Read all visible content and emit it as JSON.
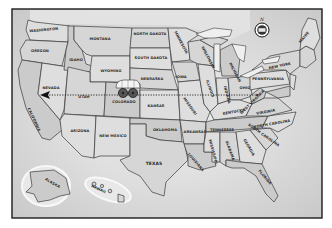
{
  "map": {
    "title": "United States",
    "style": "hand-drawn grayscale",
    "compass": {
      "label": "N",
      "icon": "compass-rose-icon"
    },
    "route": {
      "description": "dotted line with arrow pointing west",
      "from": "Colorado",
      "to": "Nevada",
      "marker": "covered-wagon-icon"
    },
    "states": [
      {
        "name": "WASHINGTON",
        "x": 44,
        "y": 31,
        "r": -5
      },
      {
        "name": "OREGON",
        "x": 40,
        "y": 52,
        "r": 0
      },
      {
        "name": "CALIFORNIA",
        "x": 33,
        "y": 120,
        "r": 65
      },
      {
        "name": "NEVADA",
        "x": 51,
        "y": 89,
        "r": 0
      },
      {
        "name": "IDAHO",
        "x": 76,
        "y": 61,
        "r": 0
      },
      {
        "name": "MONTANA",
        "x": 100,
        "y": 40,
        "r": 0
      },
      {
        "name": "WYOMING",
        "x": 111,
        "y": 72,
        "r": 0
      },
      {
        "name": "UTAH",
        "x": 84,
        "y": 98,
        "r": 0
      },
      {
        "name": "ARIZONA",
        "x": 80,
        "y": 132,
        "r": 0
      },
      {
        "name": "COLORADO",
        "x": 124,
        "y": 103,
        "r": 0
      },
      {
        "name": "NEW MEXICO",
        "x": 113,
        "y": 137,
        "r": 0
      },
      {
        "name": "NORTH DAKOTA",
        "x": 150,
        "y": 35,
        "r": 0
      },
      {
        "name": "SOUTH DAKOTA",
        "x": 151,
        "y": 59,
        "r": 0
      },
      {
        "name": "NEBRASKA",
        "x": 152,
        "y": 80,
        "r": 0
      },
      {
        "name": "KANSAS",
        "x": 156,
        "y": 107,
        "r": 0
      },
      {
        "name": "OKLAHOMA",
        "x": 165,
        "y": 131,
        "r": 0
      },
      {
        "name": "TEXAS",
        "x": 154,
        "y": 165,
        "r": 0
      },
      {
        "name": "MINNESOTA",
        "x": 180,
        "y": 43,
        "r": 62
      },
      {
        "name": "IOWA",
        "x": 181,
        "y": 78,
        "r": 0
      },
      {
        "name": "MISSOURI",
        "x": 189,
        "y": 107,
        "r": 55
      },
      {
        "name": "ARKANSAS",
        "x": 195,
        "y": 133,
        "r": 0
      },
      {
        "name": "LOUISIANA",
        "x": 195,
        "y": 163,
        "r": 50
      },
      {
        "name": "WISCONSIN",
        "x": 207,
        "y": 58,
        "r": 62
      },
      {
        "name": "ILLINOIS",
        "x": 209,
        "y": 89,
        "r": 70
      },
      {
        "name": "MICHIGAN",
        "x": 234,
        "y": 73,
        "r": 62
      },
      {
        "name": "INDIANA",
        "x": 226,
        "y": 95,
        "r": 75
      },
      {
        "name": "OHIO",
        "x": 245,
        "y": 89,
        "r": 0
      },
      {
        "name": "KENTUCKY",
        "x": 234,
        "y": 113,
        "r": -10
      },
      {
        "name": "TENNESSEE",
        "x": 222,
        "y": 131,
        "r": 0
      },
      {
        "name": "MISSISSIPPI",
        "x": 212,
        "y": 152,
        "r": 75
      },
      {
        "name": "ALABAMA",
        "x": 229,
        "y": 151,
        "r": 70
      },
      {
        "name": "GEORGIA",
        "x": 248,
        "y": 148,
        "r": 60
      },
      {
        "name": "FLORIDA",
        "x": 264,
        "y": 178,
        "r": 50
      },
      {
        "name": "SOUTH CAROLINA",
        "x": 263,
        "y": 136,
        "r": 35
      },
      {
        "name": "NORTH CAROLINA",
        "x": 272,
        "y": 125,
        "r": -10
      },
      {
        "name": "VIRGINIA",
        "x": 266,
        "y": 113,
        "r": -10
      },
      {
        "name": "WEST VIRGINIA",
        "x": 253,
        "y": 103,
        "r": -45
      },
      {
        "name": "PENNSYLVANIA",
        "x": 268,
        "y": 80,
        "r": 0
      },
      {
        "name": "NEW YORK",
        "x": 280,
        "y": 67,
        "r": -12
      },
      {
        "name": "MAINE",
        "x": 305,
        "y": 38,
        "r": -50
      },
      {
        "name": "ALASKA",
        "x": 52,
        "y": 184,
        "r": 30
      },
      {
        "name": "HAWAII",
        "x": 98,
        "y": 190,
        "r": 25
      }
    ]
  }
}
